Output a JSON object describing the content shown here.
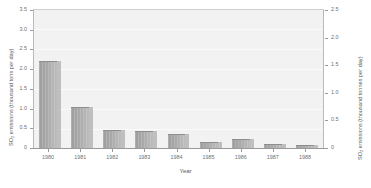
{
  "chart_data": {
    "type": "bar",
    "title": "",
    "xlabel": "Year",
    "ylabel": "SO₂ emissions (thousand tons per day)",
    "ylabel_right": "SO₂ emissions (thousand tonnes per day)",
    "categories": [
      "1980",
      "1981",
      "1982",
      "1983",
      "1984",
      "1985",
      "1986",
      "1987",
      "1988"
    ],
    "values": [
      2.2,
      1.05,
      0.45,
      0.42,
      0.35,
      0.15,
      0.22,
      0.09,
      0.07
    ],
    "ylim": [
      0,
      3.5
    ],
    "yticks": [
      "0",
      "0.5",
      "1.0",
      "1.5",
      "2.0",
      "2.5",
      "3.0",
      "3.5"
    ],
    "ylim_right": [
      0,
      2.5
    ],
    "yticks_right": [
      "0",
      "0.5",
      "1.0",
      "1.5",
      "2.0",
      "2.5"
    ],
    "grid": true,
    "legend": "none",
    "series": [
      {
        "name": "SO2 emissions",
        "values": [
          2.2,
          1.05,
          0.45,
          0.42,
          0.35,
          0.15,
          0.22,
          0.09,
          0.07
        ]
      }
    ],
    "colors": {
      "bar_fill": "#a9a9a9",
      "bar_shadow": "#b6b6b6",
      "plot_background": "#f2f2f2",
      "axis": "#9a9a9a",
      "text": "#6f6f6f"
    }
  }
}
